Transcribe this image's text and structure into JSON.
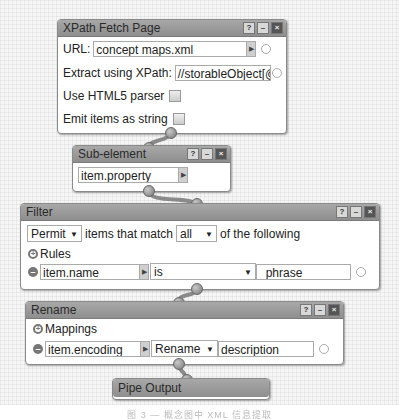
{
  "modules": {
    "xpath_fetch": {
      "title": "XPath Fetch Page",
      "url_label": "URL:",
      "url_value": "concept maps.xml",
      "xpath_label": "Extract using XPath:",
      "xpath_value": "//storableObject[@s",
      "html5_label": "Use HTML5 parser",
      "html5_checked": false,
      "emit_label": "Emit items as string",
      "emit_checked": false
    },
    "sub_element": {
      "title": "Sub-element",
      "value": "item.property"
    },
    "filter": {
      "title": "Filter",
      "mode": "Permit",
      "mode_text": "items that match",
      "match": "all",
      "match_suffix": "of the following",
      "rules_label": "Rules",
      "rule": {
        "field": "item.name",
        "operator": "is",
        "value": "_phrase"
      }
    },
    "rename": {
      "title": "Rename",
      "mappings_label": "Mappings",
      "mapping": {
        "field": "item.encoding",
        "action": "Rename",
        "value": "description"
      }
    },
    "pipe_output": {
      "title": "Pipe Output"
    }
  },
  "title_buttons": {
    "help": "?",
    "minimize": "–",
    "close": "×"
  },
  "icons": {
    "dropdown": "▼",
    "field_arrow": "▶",
    "plus": "+",
    "minus": "–"
  },
  "caption": "图 3 — 概念图中 XML 信息提取"
}
